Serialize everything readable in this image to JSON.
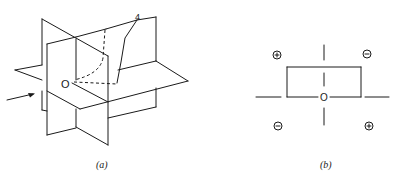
{
  "figure_a": {
    "caption": "(a)",
    "origin_label": "O",
    "surface_label": "4",
    "arrow": "incident-direction-arrow"
  },
  "figure_b": {
    "caption": "(b)",
    "origin_label": "O",
    "quadrant_signs": {
      "top_left": "+",
      "top_right": "−",
      "bottom_left": "−",
      "bottom_right": "+"
    }
  },
  "colors": {
    "line": "#1a1a1a",
    "background": "#ffffff"
  }
}
